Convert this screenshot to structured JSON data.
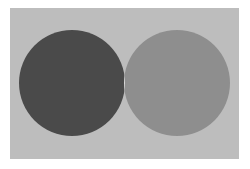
{
  "diagram": {
    "type": "venn",
    "background_color": "#bdbdbd",
    "sets": [
      {
        "name": "left-set",
        "color": "#4a4a4a",
        "cx": 72,
        "cy": 83,
        "r": 53
      },
      {
        "name": "right-set",
        "color": "#8e8e8e",
        "cx": 177,
        "cy": 83,
        "r": 53
      }
    ],
    "intersection_color": "#dadada"
  }
}
